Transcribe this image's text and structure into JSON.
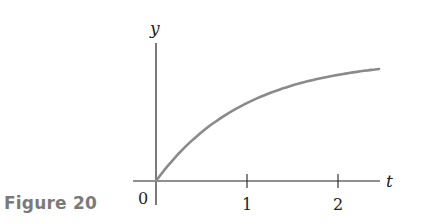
{
  "figure": {
    "label": "Figure 20",
    "label_color": "#7a7a7a",
    "curve_color": "#8a8a8a",
    "axis_color": "#222222"
  },
  "chart_data": {
    "type": "line",
    "title": "",
    "xlabel": "t",
    "ylabel": "y",
    "origin_label": "0",
    "x_ticks": [
      1,
      2
    ],
    "x_tick_labels": [
      "1",
      "2"
    ],
    "y_ticks": [],
    "xlim": [
      -0.25,
      2.45
    ],
    "grid": false,
    "legend": null,
    "series": [
      {
        "name": "y(t)",
        "description": "Increasing concave-down curve starting at origin, approaching a horizontal asymptote (form y = A(1 - e^{-kt}))",
        "x": [
          0,
          0.25,
          0.5,
          0.75,
          1.0,
          1.25,
          1.5,
          1.75,
          2.0,
          2.25,
          2.45
        ],
        "y_relative": [
          0,
          0.23,
          0.4,
          0.53,
          0.64,
          0.72,
          0.78,
          0.83,
          0.87,
          0.9,
          0.92
        ]
      }
    ]
  }
}
